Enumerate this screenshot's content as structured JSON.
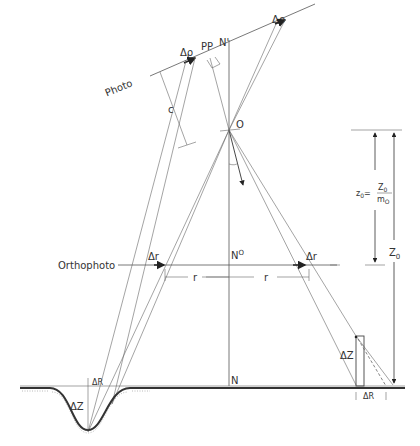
{
  "diagram": {
    "labels": {
      "photo": "Photo",
      "orthophoto": "Orthophoto",
      "delta_rho_left": "Δρ",
      "delta_rho_right": "Δρ",
      "pp": "PP",
      "n_prime": "N'",
      "c": "c",
      "o": "O",
      "n_o": "N",
      "n_o_sup": "O",
      "n": "N",
      "delta_r_left": "Δr",
      "delta_r_right": "Δr",
      "r_left": "r",
      "r_right": "r",
      "delta_z_left": "ΔZ",
      "delta_z_right": "ΔZ",
      "delta_R_left": "ΔR",
      "delta_R_right": "ΔR",
      "z0_lhs": "z",
      "z0_lhs_sub": "0",
      "z0_eq": "=",
      "z0_num": "Z",
      "z0_num_sub": "0",
      "z0_den": "m",
      "z0_den_sub": "O",
      "Z0": "Z",
      "Z0_sub": "0"
    }
  }
}
